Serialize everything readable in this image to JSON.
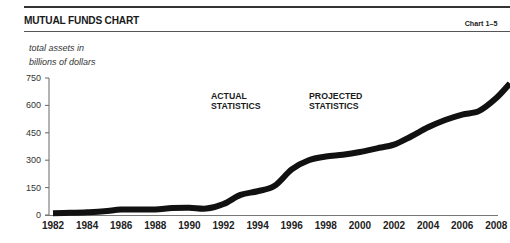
{
  "header": {
    "title": "MUTUAL FUNDS CHART",
    "chart_id": "Chart 1–5"
  },
  "chart_data": {
    "type": "line",
    "title": "MUTUAL FUNDS CHART",
    "subtitle": "Chart 1–5",
    "ylabel": "total assets in billions of dollars",
    "ylabel_lines": [
      "total assets in",
      "billions of dollars"
    ],
    "xlabel": "",
    "ylim": [
      0,
      750
    ],
    "yticks": [
      0,
      150,
      300,
      450,
      600,
      750
    ],
    "xticks": [
      "1982",
      "1984",
      "1986",
      "1988",
      "1990",
      "1992",
      "1994",
      "1996",
      "1998",
      "2000",
      "2002",
      "2004",
      "2006",
      "2008"
    ],
    "grid": false,
    "legend": null,
    "annotations": [
      {
        "text": "ACTUAL STATISTICS",
        "lines": [
          "ACTUAL",
          "STATISTICS"
        ]
      },
      {
        "text": "PROJECTED STATISTICS",
        "lines": [
          "PROJECTED",
          "STATISTICS"
        ]
      }
    ],
    "series": [
      {
        "name": "Total assets",
        "x": [
          1982,
          1983,
          1984,
          1985,
          1986,
          1987,
          1988,
          1989,
          1990,
          1991,
          1992,
          1993,
          1994,
          1995,
          1996,
          1997,
          1998,
          1999,
          2000,
          2001,
          2002,
          2003,
          2004,
          2005,
          2006,
          2007,
          2008,
          2008.8
        ],
        "values": [
          10,
          12,
          15,
          20,
          30,
          30,
          30,
          38,
          40,
          35,
          60,
          110,
          130,
          160,
          250,
          300,
          320,
          330,
          345,
          365,
          385,
          430,
          480,
          520,
          550,
          570,
          640,
          720
        ]
      }
    ]
  }
}
